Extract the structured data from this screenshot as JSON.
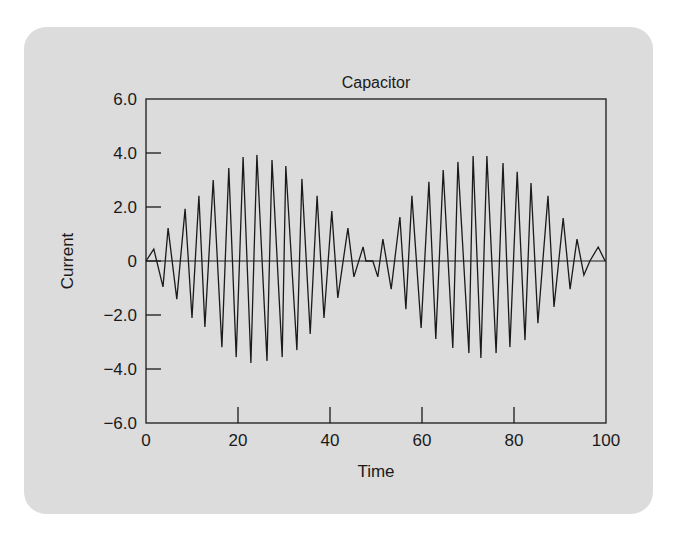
{
  "chart_data": {
    "type": "line",
    "title": "Capacitor",
    "xlabel": "Time",
    "ylabel": "Current",
    "xlim": [
      0,
      100
    ],
    "ylim": [
      -6,
      6
    ],
    "xticks": [
      0,
      20,
      40,
      60,
      80,
      100
    ],
    "xtick_labels": [
      "0",
      "20",
      "40",
      "60",
      "80",
      "100"
    ],
    "yticks": [
      6,
      4,
      2,
      0,
      -2,
      -4,
      -6
    ],
    "ytick_labels": [
      "6.0",
      "4.0",
      "2.0",
      "0",
      "−2.0",
      "−4.0",
      "−6.0"
    ],
    "grid": false,
    "zero_line": true,
    "colors": {
      "line": "#1a1a1a",
      "card": "#dcdcdc",
      "background": "#ffffff"
    },
    "series": [
      {
        "name": "Current",
        "x": [
          0,
          1.7,
          3.7,
          4.8,
          6.7,
          8.5,
          10.0,
          11.5,
          12.8,
          14.6,
          16.5,
          18.0,
          19.6,
          21.1,
          22.8,
          24.1,
          26.3,
          27.4,
          29.6,
          30.4,
          32.8,
          33.9,
          35.7,
          37.2,
          38.7,
          40.4,
          41.7,
          43.9,
          45.2,
          47.2,
          47.8,
          49.3,
          50.4,
          51.5,
          53.3,
          55.2,
          56.5,
          57.8,
          59.8,
          61.5,
          63.0,
          64.6,
          66.7,
          67.8,
          70.2,
          71.1,
          72.8,
          74.1,
          76.1,
          77.6,
          79.1,
          80.7,
          82.4,
          83.7,
          85.2,
          87.4,
          88.7,
          90.7,
          92.2,
          93.7,
          95.2,
          96.5,
          98.3,
          99.8
        ],
        "y": [
          0,
          0.44,
          -0.96,
          1.22,
          -1.41,
          1.93,
          -2.11,
          2.41,
          -2.44,
          3.0,
          -3.19,
          3.44,
          -3.56,
          3.85,
          -3.78,
          3.93,
          -3.7,
          3.74,
          -3.56,
          3.52,
          -3.3,
          3.04,
          -2.7,
          2.41,
          -2.11,
          1.85,
          -1.37,
          1.22,
          -0.59,
          0.52,
          0,
          0,
          -0.59,
          0.81,
          -1.04,
          1.63,
          -1.78,
          2.41,
          -2.48,
          2.93,
          -2.89,
          3.37,
          -3.22,
          3.67,
          -3.41,
          3.89,
          -3.59,
          3.89,
          -3.41,
          3.63,
          -3.19,
          3.3,
          -2.93,
          2.89,
          -2.3,
          2.41,
          -1.7,
          1.59,
          -1.04,
          0.81,
          -0.52,
          0,
          0.52,
          0
        ]
      }
    ]
  }
}
